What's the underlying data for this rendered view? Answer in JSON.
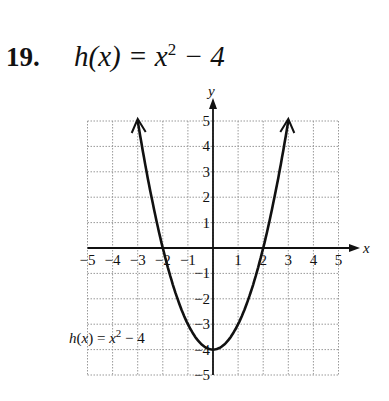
{
  "problem": {
    "number": "19.",
    "equation_lhs": "h(x) = x",
    "equation_exp": "2",
    "equation_rhs": " − 4"
  },
  "chart_data": {
    "type": "line",
    "xlabel": "x",
    "ylabel": "y",
    "xlim": [
      -5,
      5
    ],
    "ylim": [
      -5,
      5
    ],
    "grid": true,
    "x_ticks": [
      -5,
      -4,
      -3,
      -2,
      -1,
      1,
      2,
      3,
      4,
      5
    ],
    "y_ticks": [
      -5,
      -4,
      -3,
      -2,
      -1,
      1,
      2,
      3,
      4,
      5
    ],
    "series": [
      {
        "name": "h(x) = x^2 - 4",
        "x": [
          -3,
          -2,
          -1,
          0,
          1,
          2,
          3
        ],
        "values": [
          5,
          0,
          -3,
          -4,
          -3,
          0,
          5
        ]
      }
    ],
    "annotation": "h(x) = x² − 4"
  }
}
